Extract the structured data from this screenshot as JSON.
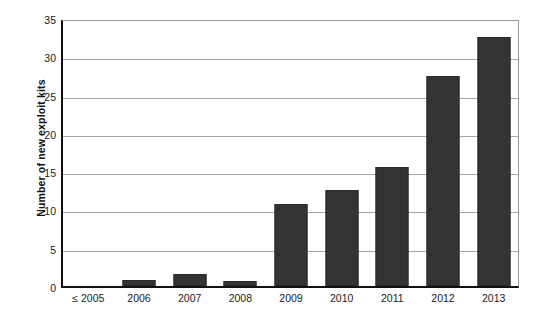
{
  "chart_data": {
    "type": "bar",
    "title": "",
    "subtitle": "",
    "xlabel": "",
    "ylabel": "Number of new exploit kits",
    "categories": [
      "≤ 2005",
      "2006",
      "2007",
      "2008",
      "2009",
      "2010",
      "2011",
      "2012",
      "2013"
    ],
    "values": [
      0,
      0.8,
      1.6,
      0.7,
      10.7,
      12.6,
      15.5,
      27.4,
      32.5
    ],
    "series": [
      {
        "name": "Number of new exploit kits",
        "values": [
          0,
          0.8,
          1.6,
          0.7,
          10.7,
          12.6,
          15.5,
          27.4,
          32.5
        ]
      }
    ],
    "ylim": [
      0,
      35
    ],
    "ytick_values": [
      0,
      5,
      10,
      15,
      20,
      25,
      30,
      35
    ],
    "ytick_labels": [
      "0",
      "5",
      "10",
      "15",
      "20",
      "25",
      "30",
      "35"
    ],
    "grid": true,
    "grid_axis": "y",
    "legend": false,
    "legend_position": "none",
    "bar_color": "#333333",
    "grid_color": "#a6a6a6",
    "axis_color": "#111111",
    "frame_color": "#9a9a9a",
    "background_color": "#ffffff",
    "annotations": []
  }
}
